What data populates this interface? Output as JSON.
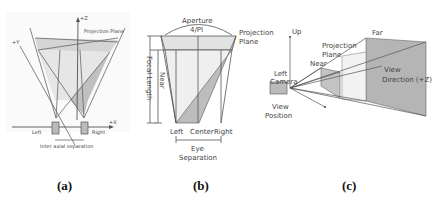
{
  "panels": {
    "a": {
      "caption": "(a)",
      "labels": {
        "z_axis": "+Z",
        "y_axis": "+Y",
        "x_axis": "+X",
        "projection_plane": "Projection Plane",
        "left": "Left",
        "right": "Right",
        "separation": "Inter axial separation"
      }
    },
    "b": {
      "caption": "(b)",
      "labels": {
        "aperture": "Aperture",
        "aperture_value": "4/PI",
        "projection": "Projection",
        "plane": "Plane",
        "near": "Near",
        "focal_length": "Focal Length",
        "left": "Left",
        "center": "Center",
        "right": "Right",
        "eye": "Eye",
        "separation": "Separation"
      }
    },
    "c": {
      "caption": "(c)",
      "labels": {
        "up": "Up",
        "far": "Far",
        "projection": "Projection",
        "plane": "Plane",
        "near": "Near",
        "left": "Left",
        "camera": "Camera",
        "view": "View",
        "position": "Position",
        "view_direction_1": "View",
        "view_direction_2": "Direction (+Z)"
      }
    }
  },
  "colors": {
    "line": "#555555",
    "shade_light": "#e2e2e2",
    "shade_dark": "#b8b8b8",
    "text": "#444444"
  }
}
